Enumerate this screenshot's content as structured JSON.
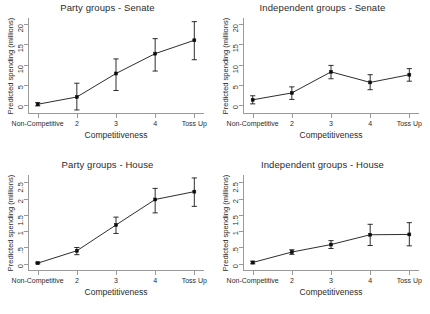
{
  "figure": {
    "background": "#ffffff",
    "ink": "#161616",
    "axis_color": "#9a9a9a"
  },
  "shared": {
    "xlabel": "Competitiveness",
    "ylabel": "Predicted spending (millions)",
    "xticklabels": [
      "Non-Competitive",
      "2",
      "3",
      "4",
      "Toss Up"
    ],
    "categories": [
      "Non-Competitive",
      "2",
      "3",
      "4",
      "Toss Up"
    ]
  },
  "chart_data": [
    {
      "type": "line",
      "panel": "top-left",
      "title": "Party groups - Senate",
      "xlabel": "Competitiveness",
      "ylabel": "Predicted spending (millions)",
      "categories": [
        "Non-Competitive",
        "2",
        "3",
        "4",
        "Toss Up"
      ],
      "xticklabels": [
        "Non-Competitive",
        "2",
        "3",
        "4",
        "Toss Up"
      ],
      "yticks": [
        0,
        5,
        10,
        15,
        20
      ],
      "yticklabels": [
        "0",
        "5",
        "10",
        "15",
        "20"
      ],
      "ylim": [
        -2.2,
        21.5
      ],
      "grid": false,
      "legend": "none",
      "marker": "filled-square",
      "errorbars": true,
      "values": [
        0.2,
        2.0,
        7.8,
        12.7,
        16.0
      ],
      "ci_low": [
        -0.2,
        -1.2,
        3.6,
        8.4,
        11.2
      ],
      "ci_high": [
        0.6,
        5.4,
        11.4,
        16.4,
        20.6
      ]
    },
    {
      "type": "line",
      "panel": "top-right",
      "title": "Independent groups - Senate",
      "xlabel": "Competitiveness",
      "ylabel": "Predicted spending (millions)",
      "categories": [
        "Non-Competitive",
        "2",
        "3",
        "4",
        "Toss Up"
      ],
      "xticklabels": [
        "Non-Competitive",
        "2",
        "3",
        "4",
        "Toss Up"
      ],
      "yticks": [
        0,
        5,
        10,
        15,
        20
      ],
      "yticklabels": [
        "0",
        "5",
        "10",
        "15",
        "20"
      ],
      "ylim": [
        -2.2,
        21.5
      ],
      "grid": false,
      "legend": "none",
      "marker": "filled-square",
      "errorbars": true,
      "values": [
        1.3,
        3.0,
        8.2,
        5.6,
        7.5
      ],
      "ci_low": [
        0.3,
        1.4,
        6.5,
        3.8,
        5.9
      ],
      "ci_high": [
        2.3,
        4.5,
        9.8,
        7.5,
        9.0
      ]
    },
    {
      "type": "line",
      "panel": "bottom-left",
      "title": "Party groups - House",
      "xlabel": "Competitiveness",
      "ylabel": "Predicted spending (millions)",
      "categories": [
        "Non-Competitive",
        "2",
        "3",
        "4",
        "Toss Up"
      ],
      "xticklabels": [
        "Non-Competitive",
        "2",
        "3",
        "4",
        "Toss Up"
      ],
      "yticks": [
        0,
        0.5,
        1,
        1.5,
        2,
        2.5
      ],
      "yticklabels": [
        "0",
        ".5",
        "1",
        "1.5",
        "2",
        "2.5"
      ],
      "ylim": [
        -0.22,
        2.72
      ],
      "grid": false,
      "legend": "none",
      "marker": "filled-square",
      "errorbars": true,
      "values": [
        0.02,
        0.4,
        1.19,
        1.97,
        2.21
      ],
      "ci_low": [
        0.0,
        0.28,
        0.93,
        1.56,
        1.76
      ],
      "ci_high": [
        0.05,
        0.5,
        1.43,
        2.31,
        2.63
      ]
    },
    {
      "type": "line",
      "panel": "bottom-right",
      "title": "Independent groups - House",
      "xlabel": "Competitiveness",
      "ylabel": "Predicted spending (millions)",
      "categories": [
        "Non-Competitive",
        "2",
        "3",
        "4",
        "Toss Up"
      ],
      "xticklabels": [
        "Non-Competitive",
        "2",
        "3",
        "4",
        "Toss Up"
      ],
      "yticks": [
        0,
        0.5,
        1,
        1.5,
        2,
        2.5
      ],
      "yticklabels": [
        "0",
        ".5",
        "1",
        "1.5",
        "2",
        "2.5"
      ],
      "ylim": [
        -0.22,
        2.72
      ],
      "grid": false,
      "legend": "none",
      "marker": "filled-square",
      "errorbars": true,
      "values": [
        0.04,
        0.36,
        0.59,
        0.89,
        0.9
      ],
      "ci_low": [
        0.0,
        0.29,
        0.47,
        0.56,
        0.55
      ],
      "ci_high": [
        0.08,
        0.43,
        0.71,
        1.21,
        1.26
      ]
    }
  ]
}
